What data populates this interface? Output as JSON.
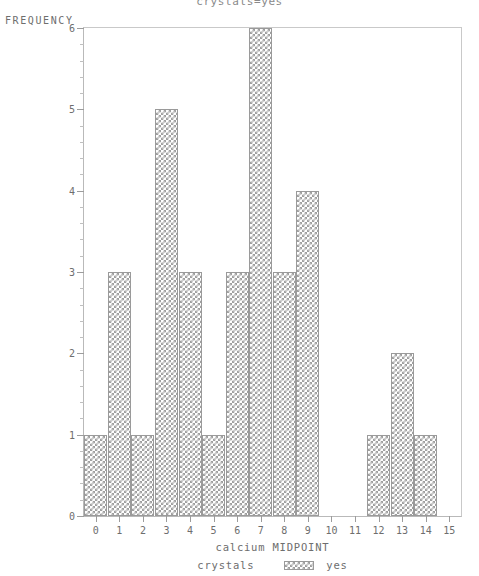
{
  "chart_data": {
    "type": "bar",
    "title": "crystals=yes",
    "xlabel": "calcium MIDPOINT",
    "ylabel": "FREQUENCY",
    "categories": [
      0,
      1,
      2,
      3,
      4,
      5,
      6,
      7,
      8,
      9,
      10,
      11,
      12,
      13,
      14,
      15
    ],
    "values": [
      1,
      3,
      1,
      5,
      3,
      1,
      3,
      6,
      3,
      4,
      0,
      0,
      1,
      2,
      1,
      0
    ],
    "xlim": [
      -0.5,
      15.5
    ],
    "ylim": [
      0,
      6
    ],
    "xticks": [
      "0",
      "1",
      "2",
      "3",
      "4",
      "5",
      "6",
      "7",
      "8",
      "9",
      "10",
      "11",
      "12",
      "13",
      "14",
      "15"
    ],
    "yticks": [
      "0",
      "1",
      "2",
      "3",
      "4",
      "5",
      "6"
    ],
    "y_minor_ticks_per_interval": 5,
    "grid": false,
    "legend": {
      "position": "bottom",
      "title": "crystals",
      "entries": [
        {
          "label": "yes",
          "pattern": "cross-hatch",
          "color": "#9f9f9f"
        }
      ]
    },
    "colors": {
      "bar_fill": "#ffffff",
      "bar_hatch": "#9f9f9f",
      "bar_edge": "#9a9a9a",
      "axis": "#9c9c9c",
      "text": "#6e6e6e",
      "background": "#ffffff"
    }
  }
}
